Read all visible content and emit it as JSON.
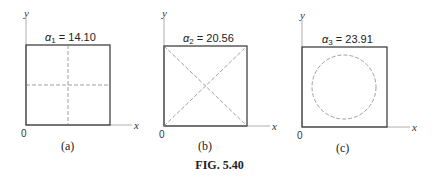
{
  "figure": {
    "caption": "FIG. 5.40",
    "axis_x_label": "x",
    "axis_y_label": "y",
    "origin_label": "0",
    "colors": {
      "line": "#333333",
      "dashed": "#777777",
      "background": "#ffffff"
    },
    "panels": [
      {
        "id": "a",
        "sublabel": "(a)",
        "alpha_symbol": "α",
        "alpha_sub": "1",
        "alpha_eq": " = 14.10",
        "pattern": "cross-dashed-center-lines"
      },
      {
        "id": "b",
        "sublabel": "(b)",
        "alpha_symbol": "α",
        "alpha_sub": "2",
        "alpha_eq": " = 20.56",
        "pattern": "dashed-diagonals"
      },
      {
        "id": "c",
        "sublabel": "(c)",
        "alpha_symbol": "α",
        "alpha_sub": "3",
        "alpha_eq": " = 23.91",
        "pattern": "dashed-inscribed-circle"
      }
    ]
  }
}
